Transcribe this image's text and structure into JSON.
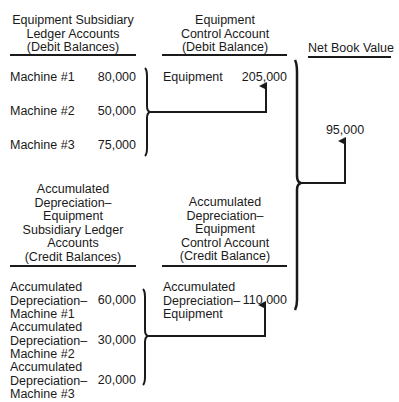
{
  "equipment_subsidiary": {
    "header": [
      "Equipment Subsidiary",
      "Ledger Accounts",
      "(Debit Balances)"
    ],
    "rows": [
      {
        "label": "Machine #1",
        "value": "80,000"
      },
      {
        "label": "Machine #2",
        "value": "50,000"
      },
      {
        "label": "Machine #3",
        "value": "75,000"
      }
    ]
  },
  "equipment_control": {
    "header": [
      "Equipment",
      "Control Account",
      "(Debit Balance)"
    ],
    "label": "Equipment",
    "value": "205,000"
  },
  "net_book_value": {
    "header": "Net Book Value",
    "value": "95,000"
  },
  "accum_dep_subsidiary": {
    "header": [
      "Accumulated",
      "Depreciation–",
      "Equipment",
      "Subsidiary Ledger",
      "Accounts",
      "(Credit Balances)"
    ],
    "rows": [
      {
        "label": [
          "Accumulated",
          "Depreciation–",
          "Machine #1"
        ],
        "value": "60,000"
      },
      {
        "label": [
          "Accumulated",
          "Depreciation–",
          "Machine #2"
        ],
        "value": "30,000"
      },
      {
        "label": [
          "Accumulated",
          "Depreciation–",
          "Machine #3"
        ],
        "value": "20,000"
      }
    ]
  },
  "accum_dep_control": {
    "header": [
      "Accumulated",
      "Depreciation–",
      "Equipment",
      "Control Account",
      "(Credit Balance)"
    ],
    "label": [
      "Accumulated",
      "Depreciation–",
      "Equipment"
    ],
    "value": "110,000"
  }
}
